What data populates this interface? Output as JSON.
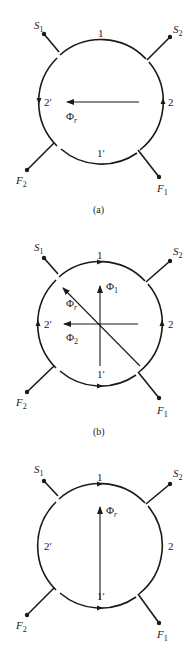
{
  "panels": [
    {
      "caption": "(a)",
      "center": [
        101,
        102
      ],
      "labels": {
        "top": "1",
        "bottom": "1′",
        "left": "2′",
        "right": "2",
        "s1": "S",
        "s1_sub": "1",
        "s2": "S",
        "s2_sub": "2",
        "f1": "F",
        "f1_sub": "1",
        "f2": "F",
        "f2_sub": "2"
      },
      "vectors": [
        {
          "name": "Φ",
          "sub": "r",
          "direction": "left"
        }
      ]
    },
    {
      "caption": "(b)",
      "center": [
        100,
        324
      ],
      "labels": {
        "top": "1",
        "bottom": "1′",
        "left": "2′",
        "right": "2",
        "s1": "S",
        "s1_sub": "1",
        "s2": "S",
        "s2_sub": "2",
        "f1": "F",
        "f1_sub": "1",
        "f2": "F",
        "f2_sub": "2"
      },
      "vectors": [
        {
          "name": "Φ",
          "sub": "1",
          "direction": "up"
        },
        {
          "name": "Φ",
          "sub": "2",
          "direction": "left"
        },
        {
          "name": "Φ",
          "sub": "r",
          "direction": "up-left"
        }
      ]
    },
    {
      "caption": "",
      "center": [
        100,
        546
      ],
      "labels": {
        "top": "1",
        "bottom": "1′",
        "left": "2′",
        "right": "2",
        "s1": "S",
        "s1_sub": "1",
        "s2": "S",
        "s2_sub": "2",
        "f1": "F",
        "f1_sub": "1",
        "f2": "F",
        "f2_sub": "2"
      },
      "vectors": [
        {
          "name": "Φ",
          "sub": "r",
          "direction": "up"
        }
      ]
    }
  ]
}
